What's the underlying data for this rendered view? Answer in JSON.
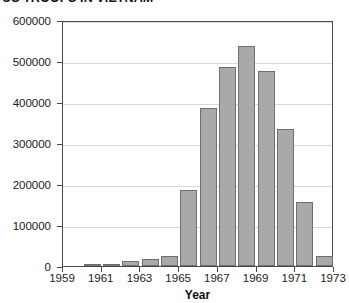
{
  "chart_data": {
    "type": "bar",
    "title": "US TROOPS IN VIETNAM",
    "xlabel": "Year",
    "ylabel": "",
    "ylim": [
      0,
      600000
    ],
    "grid": true,
    "legend": false,
    "categories": [
      1960,
      1961,
      1962,
      1963,
      1964,
      1965,
      1966,
      1967,
      1968,
      1969,
      1970,
      1971,
      1972
    ],
    "values": [
      900,
      3200,
      11500,
      16300,
      23300,
      184300,
      385300,
      485600,
      536100,
      475200,
      334600,
      156800,
      24200
    ],
    "y_ticks": [
      0,
      100000,
      200000,
      300000,
      400000,
      500000,
      600000
    ],
    "y_tick_labels": [
      "0",
      "100000",
      "200000",
      "300000",
      "400000",
      "500000",
      "600000"
    ],
    "x_ticks": [
      1959,
      1961,
      1963,
      1965,
      1967,
      1969,
      1971,
      1973
    ],
    "x_tick_labels": [
      "1959",
      "1961",
      "1963",
      "1965",
      "1967",
      "1969",
      "1971",
      "1973"
    ],
    "bar_color": "#a9a9a9",
    "bar_edge_color": "#6f6f6f",
    "grid_color": "#d9d9d9",
    "axis_color": "#4a4a4a"
  }
}
